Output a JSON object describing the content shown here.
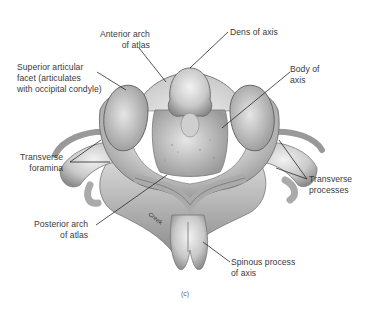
{
  "figure": {
    "caption": "(c)",
    "signature": "Creek",
    "labels": {
      "anterior_arch": {
        "line1": "Anterior arch",
        "line2": "of atlas"
      },
      "dens": {
        "line1": "Dens of axis"
      },
      "superior_facet": {
        "line1": "Superior articular",
        "line2": "facet (articulates",
        "line3": "with occipital condyle)"
      },
      "body_axis": {
        "line1": "Body of",
        "line2": "axis"
      },
      "transverse_foramina": {
        "line1": "Transverse",
        "line2": "foramina"
      },
      "transverse_processes": {
        "line1": "Transverse",
        "line2": "processes"
      },
      "posterior_arch": {
        "line1": "Posterior arch",
        "line2": "of atlas"
      },
      "spinous_process": {
        "line1": "Spinous process",
        "line2": "of axis"
      }
    }
  }
}
